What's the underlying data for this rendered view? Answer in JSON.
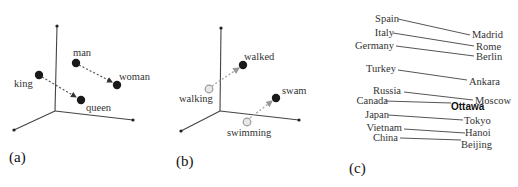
{
  "panels": {
    "a": {
      "label": "(a)",
      "words": {
        "king": "king",
        "queen": "queen",
        "man": "man",
        "woman": "woman"
      }
    },
    "b": {
      "label": "(b)",
      "words": {
        "walking": "walking",
        "walked": "walked",
        "swimming": "swimming",
        "swam": "swam"
      }
    },
    "c": {
      "label": "(c)",
      "pairs": [
        {
          "country": "Spain",
          "capital": "Madrid"
        },
        {
          "country": "Italy",
          "capital": "Rome"
        },
        {
          "country": "Germany",
          "capital": "Berlin"
        },
        {
          "country": "Turkey",
          "capital": "Ankara"
        },
        {
          "country": "Russia",
          "capital": "Moscow"
        },
        {
          "country": "Canada",
          "capital": "Ottawa"
        },
        {
          "country": "Japan",
          "capital": "Tokyo"
        },
        {
          "country": "Vietnam",
          "capital": "Hanoi"
        },
        {
          "country": "China",
          "capital": "Beijing"
        }
      ]
    }
  },
  "colors": {
    "point_dark": "#1a1a1a",
    "point_light": "#bbbbbb",
    "arrow": "#555555"
  }
}
